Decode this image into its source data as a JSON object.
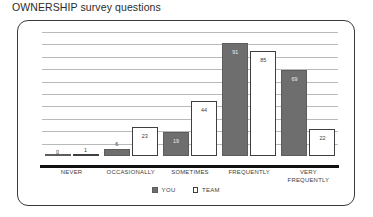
{
  "chart_data": {
    "type": "bar",
    "title": "OWNERSHIP survey questions",
    "xlabel": "",
    "ylabel": "",
    "ylim": [
      0,
      100
    ],
    "grid": true,
    "gridline_count": 10,
    "legend_position": "bottom-center",
    "categories": [
      "NEVER",
      "OCCASIONALLY",
      "SOMETIMES",
      "FREQUENTLY",
      "VERY\nFREQUENTLY"
    ],
    "series": [
      {
        "name": "YOU",
        "color": "#6e6e6e",
        "values": [
          0,
          6,
          19,
          91,
          69
        ]
      },
      {
        "name": "TEAM",
        "color": "#ffffff",
        "values": [
          1,
          23,
          44,
          85,
          22
        ]
      }
    ]
  },
  "legend": {
    "items": [
      {
        "label": "YOU",
        "swatch": "filled-square-icon"
      },
      {
        "label": "TEAM",
        "swatch": "hollow-square-icon"
      }
    ]
  }
}
